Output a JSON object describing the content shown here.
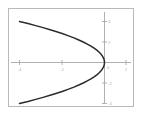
{
  "figure": {
    "frame_color": "#b9b9b9",
    "background": "#ffffff",
    "axis_color": "#a8a8a8",
    "curve_color": "#2b2b2b",
    "tick_label_color": "#b0b0b0"
  },
  "chart_data": {
    "type": "line",
    "title": "",
    "subtitle": "",
    "xlabel": "",
    "ylabel": "",
    "equation": "x = -y^2 / 4",
    "grid": false,
    "legend": null,
    "xlim": [
      -5,
      2
    ],
    "ylim": [
      -5,
      5
    ],
    "xticks": [
      -4,
      -2,
      0,
      2
    ],
    "xtick_labels": [
      "-4",
      "-2",
      "0",
      "2"
    ],
    "yticks": [
      4,
      2,
      0,
      -2,
      -4
    ],
    "ytick_labels": [
      "4",
      "2",
      "0",
      "-2",
      "-4"
    ],
    "origin_label": "0",
    "series": [
      {
        "name": "parabola",
        "x": [
          -4.0,
          -3.6,
          -3.24,
          -2.89,
          -2.56,
          -2.25,
          -1.96,
          -1.69,
          -1.44,
          -1.21,
          -1.0,
          -0.81,
          -0.64,
          -0.49,
          -0.36,
          -0.25,
          -0.16,
          -0.09,
          -0.04,
          -0.01,
          0.0,
          -0.01,
          -0.04,
          -0.09,
          -0.16,
          -0.25,
          -0.36,
          -0.49,
          -0.64,
          -0.81,
          -1.0,
          -1.21,
          -1.44,
          -1.69,
          -1.96,
          -2.25,
          -2.56,
          -2.89,
          -3.24,
          -3.6,
          -4.0
        ],
        "y": [
          4.0,
          3.8,
          3.6,
          3.4,
          3.2,
          3.0,
          2.8,
          2.6,
          2.4,
          2.2,
          2.0,
          1.8,
          1.6,
          1.4,
          1.2,
          1.0,
          0.8,
          0.6,
          0.4,
          0.2,
          0.0,
          -0.2,
          -0.4,
          -0.6,
          -0.8,
          -1.0,
          -1.2,
          -1.4,
          -1.6,
          -1.8,
          -2.0,
          -2.2,
          -2.4,
          -2.6,
          -2.8,
          -3.0,
          -3.2,
          -3.4,
          -3.6,
          -3.8,
          -4.0
        ]
      }
    ]
  }
}
